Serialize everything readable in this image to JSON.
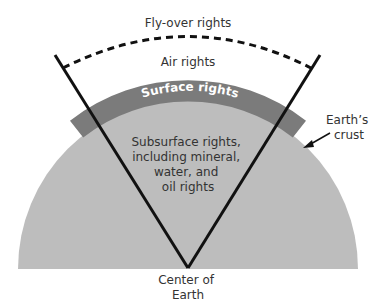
{
  "diagram": {
    "labels": {
      "flyover": "Fly-over rights",
      "air": "Air rights",
      "surface": "Surface rights",
      "subsurface_lines": [
        "Subsurface rights,",
        "including mineral,",
        "water, and",
        "oil rights"
      ],
      "crust_lines": [
        "Earth’s",
        "crust"
      ],
      "center_lines": [
        "Center of",
        "Earth"
      ]
    },
    "colors": {
      "earth_fill": "#bdbdbd",
      "crust_band": "#7b7b7b",
      "surface_text": "#ffffff",
      "lines": "#111111",
      "text": "#333333"
    }
  }
}
